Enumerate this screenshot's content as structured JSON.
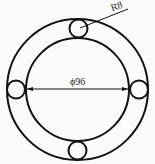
{
  "diagram": {
    "type": "engineering-drawing",
    "stroke_color": "#111111",
    "background": "#fbfbfb",
    "diameter_label": "ϕ96",
    "radius_label": "R8",
    "small_circle_count": 4
  }
}
